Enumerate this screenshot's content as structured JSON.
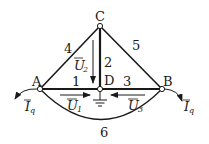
{
  "diagram": {
    "type": "circuit-network",
    "nodes": {
      "A": {
        "label": "A"
      },
      "B": {
        "label": "B"
      },
      "C": {
        "label": "C"
      },
      "D": {
        "label": "D"
      }
    },
    "branches": [
      {
        "id": "1",
        "label": "1",
        "from": "A",
        "to": "D"
      },
      {
        "id": "2",
        "label": "2",
        "from": "C",
        "to": "D"
      },
      {
        "id": "3",
        "label": "3",
        "from": "D",
        "to": "B"
      },
      {
        "id": "4",
        "label": "4",
        "from": "A",
        "to": "C"
      },
      {
        "id": "5",
        "label": "5",
        "from": "C",
        "to": "B"
      },
      {
        "id": "6",
        "label": "6",
        "from": "A",
        "to": "B"
      }
    ],
    "voltages": {
      "U1": {
        "main": "U",
        "sub": "1"
      },
      "U2": {
        "main": "U",
        "sub": "2"
      },
      "U3": {
        "main": "U",
        "sub": "3"
      }
    },
    "currents": {
      "Iq_left": {
        "main": "I",
        "sub": "q"
      },
      "Iq_right": {
        "main": "I",
        "sub": "q"
      }
    },
    "ground": {
      "node": "D"
    },
    "colors": {
      "stroke": "#1a1a1a",
      "background": "#ffffff"
    }
  }
}
